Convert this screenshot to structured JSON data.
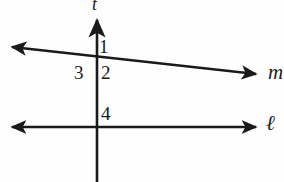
{
  "diagram": {
    "background_color": "#fefefe",
    "stroke_color": "#1a1a1a",
    "lines": [
      {
        "name": "t",
        "label": "t",
        "orientation": "vertical-transversal",
        "arrowheads": "top-only",
        "x": 97,
        "y_top": 16,
        "y_bottom": 182
      },
      {
        "name": "m",
        "label": "m",
        "orientation": "slanted",
        "arrowheads": "both",
        "x_left": 6,
        "y_left": 47,
        "x_right": 262,
        "y_right": 75
      },
      {
        "name": "l",
        "label": "ℓ",
        "orientation": "horizontal",
        "arrowheads": "both",
        "x_left": 6,
        "x_right": 262,
        "y": 127
      }
    ],
    "intersections": [
      {
        "name": "t-and-m",
        "x": 97,
        "y": 57
      },
      {
        "name": "t-and-l",
        "x": 97,
        "y": 127
      }
    ],
    "angle_labels": [
      {
        "id": "1",
        "text": "1",
        "position": "upper-right-of-m-t-intersection"
      },
      {
        "id": "2",
        "text": "2",
        "position": "lower-right-of-m-t-intersection"
      },
      {
        "id": "3",
        "text": "3",
        "position": "lower-left-of-m-t-intersection"
      },
      {
        "id": "4",
        "text": "4",
        "position": "upper-right-of-l-t-intersection"
      }
    ]
  }
}
